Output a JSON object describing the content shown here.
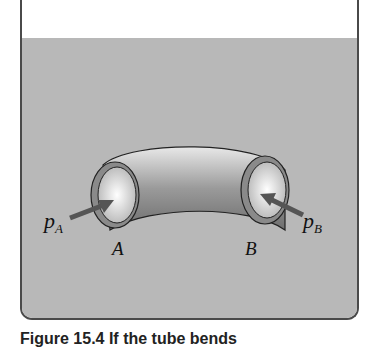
{
  "figure": {
    "labels": {
      "pressure_a": "p",
      "pressure_a_sub": "A",
      "pressure_b": "p",
      "pressure_b_sub": "B",
      "end_a": "A",
      "end_b": "B"
    },
    "caption": "Figure 15.4  If the tube bends"
  }
}
